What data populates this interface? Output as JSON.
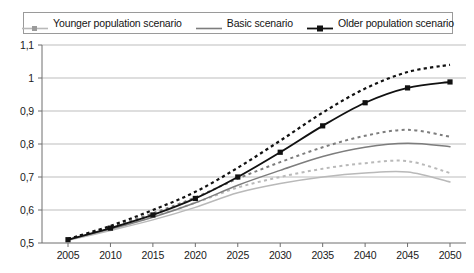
{
  "legend": {
    "position": "top",
    "border_color": "#9a9a9a",
    "entries": [
      {
        "label": "Younger population scenario",
        "color": "#b9b9b9",
        "marker": "square-small",
        "style": "solid"
      },
      {
        "label": "Basic scenario",
        "color": "#7d7d7d",
        "marker": "none",
        "style": "solid"
      },
      {
        "label": "Older population scenario",
        "color": "#111111",
        "marker": "square",
        "style": "solid"
      }
    ]
  },
  "axes": {
    "y_tick_labels": [
      "1,1",
      "1",
      "0,9",
      "0,8",
      "0,7",
      "0,6",
      "0,5"
    ],
    "x_tick_labels": [
      "2005",
      "2010",
      "2015",
      "2020",
      "2025",
      "2030",
      "2035",
      "2040",
      "2045",
      "2050"
    ],
    "grid": "horizontal",
    "grid_color": "#bdbdbd",
    "axis_color": "#6e6e6e"
  },
  "chart_data": {
    "type": "line",
    "title": "",
    "subtitle": "",
    "xlabel": "",
    "ylabel": "",
    "xlim": [
      2005,
      2050
    ],
    "ylim": [
      0.5,
      1.1
    ],
    "ytick_values": [
      0.5,
      0.6,
      0.7,
      0.8,
      0.9,
      1.0,
      1.1
    ],
    "grid": true,
    "legend_position": "top",
    "decimal_separator": ",",
    "x": [
      2005,
      2010,
      2015,
      2020,
      2025,
      2030,
      2035,
      2040,
      2045,
      2050
    ],
    "series": [
      {
        "name": "Older population scenario",
        "color": "#111111",
        "style": "solid",
        "marker": "square",
        "values": [
          0.51,
          0.545,
          0.585,
          0.635,
          0.7,
          0.775,
          0.855,
          0.925,
          0.97,
          0.988
        ]
      },
      {
        "name": "Older population scenario (upper variant)",
        "color": "#111111",
        "style": "dashed",
        "marker": "none",
        "values": [
          0.512,
          0.552,
          0.6,
          0.655,
          0.728,
          0.81,
          0.895,
          0.968,
          1.018,
          1.04
        ]
      },
      {
        "name": "Basic scenario",
        "color": "#7d7d7d",
        "style": "solid",
        "marker": "none",
        "values": [
          0.51,
          0.542,
          0.578,
          0.622,
          0.675,
          0.72,
          0.762,
          0.79,
          0.802,
          0.792
        ]
      },
      {
        "name": "Basic scenario (upper variant)",
        "color": "#7d7d7d",
        "style": "dashed",
        "marker": "none",
        "values": [
          0.512,
          0.548,
          0.59,
          0.638,
          0.695,
          0.745,
          0.79,
          0.825,
          0.843,
          0.822
        ]
      },
      {
        "name": "Younger population scenario",
        "color": "#b9b9b9",
        "style": "solid",
        "marker": "none",
        "values": [
          0.508,
          0.538,
          0.57,
          0.608,
          0.652,
          0.68,
          0.7,
          0.712,
          0.715,
          0.685
        ]
      },
      {
        "name": "Younger population scenario (upper variant)",
        "color": "#b9b9b9",
        "style": "dashed",
        "marker": "none",
        "values": [
          0.51,
          0.543,
          0.58,
          0.622,
          0.668,
          0.7,
          0.725,
          0.742,
          0.748,
          0.712
        ]
      }
    ]
  }
}
